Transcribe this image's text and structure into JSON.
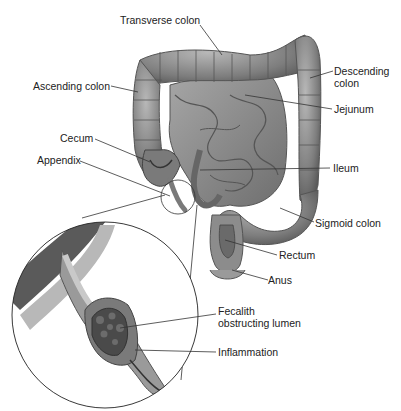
{
  "diagram": {
    "labels": {
      "transverse_colon": "Transverse colon",
      "descending_colon_1": "Descending",
      "descending_colon_2": "colon",
      "ascending_colon": "Ascending colon",
      "jejunum": "Jejunum",
      "cecum": "Cecum",
      "appendix": "Appendix",
      "ileum": "Ileum",
      "sigmoid_colon": "Sigmoid colon",
      "rectum": "Rectum",
      "anus": "Anus",
      "fecalith_1": "Fecalith",
      "fecalith_2": "obstructing lumen",
      "inflammation": "Inflammation"
    },
    "colors": {
      "tissue": "#8a8a8a",
      "tissue_dark": "#5e5e5e",
      "tissue_light": "#b5b5b5",
      "leader": "#333333"
    }
  }
}
